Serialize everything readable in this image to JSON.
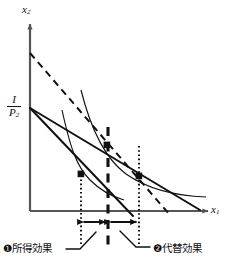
{
  "figure": {
    "type": "economics-indifference-curve-diagram",
    "title_visible": false,
    "axes": {
      "y_label": "x",
      "y_label_sub": "2",
      "x_label": "x",
      "x_label_sub": "1",
      "origin_px": [
        30,
        211
      ],
      "x_axis_end_px": [
        214,
        211
      ],
      "y_axis_end_px": [
        30,
        20
      ],
      "color": "#555555"
    },
    "y_intercept_label": {
      "numerator": "I",
      "bar": "",
      "denominator": "P",
      "denominator_sub": "2",
      "position_px": [
        8,
        97
      ]
    },
    "budget_lines": [
      {
        "name": "original-budget-line",
        "style": "solid",
        "from_px": [
          30,
          108
        ],
        "to_px": [
          200,
          210
        ],
        "color": "#111111",
        "width": 2.0
      },
      {
        "name": "new-budget-line",
        "style": "solid",
        "from_px": [
          30,
          108
        ],
        "to_px": [
          133,
          215
        ],
        "color": "#111111",
        "width": 2.0
      },
      {
        "name": "compensated-budget-line",
        "style": "dashed",
        "from_px": [
          30,
          53
        ],
        "to_px": [
          168,
          213
        ],
        "color": "#111111",
        "width": 2.0,
        "dash": "7,5"
      }
    ],
    "indifference_curves": [
      {
        "name": "lower-indifference-curve",
        "color": "#111111",
        "width": 1.1,
        "path": "M 62,110 C 72,150 78,168 92,182 C 102,192 112,197 124,200"
      },
      {
        "name": "upper-indifference-curve",
        "color": "#111111",
        "width": 1.1,
        "path": "M 81,90 C 92,128 104,158 126,175 C 148,191 178,196 206,197"
      }
    ],
    "vertical_lines": [
      {
        "name": "dotted-line-left",
        "x_px": 81,
        "from_y_px": 172,
        "to_y_px": 243,
        "style": "dotted",
        "color": "#111111",
        "width": 2.0
      },
      {
        "name": "dashed-line-middle",
        "x_px": 108,
        "from_y_px": 127,
        "to_y_px": 248,
        "style": "dashed",
        "color": "#111111",
        "width": 3.0
      },
      {
        "name": "dotted-line-right",
        "x_px": 139,
        "from_y_px": 147,
        "to_y_px": 243,
        "style": "dotted",
        "color": "#111111",
        "width": 2.0
      }
    ],
    "tangency_points": [
      {
        "name": "tangency-point-left",
        "x_px": 81,
        "y_px": 174
      },
      {
        "name": "tangency-point-middle",
        "x_px": 107,
        "y_px": 145
      },
      {
        "name": "tangency-point-right",
        "x_px": 139,
        "y_px": 176
      }
    ],
    "effect_arrows": [
      {
        "name": "income-effect-arrow",
        "from_x_px": 82,
        "to_x_px": 107,
        "y_px": 222,
        "double_headed": true
      },
      {
        "name": "substitution-effect-arrow",
        "from_x_px": 109,
        "to_x_px": 138,
        "y_px": 222,
        "double_headed": true
      }
    ],
    "annotations": [
      {
        "name": "income-effect-label",
        "marker": "❶",
        "text": "所得効果",
        "full": "❶所得効果",
        "position_px": [
          4,
          247
        ],
        "leader_from_px": [
          68,
          248
        ],
        "leader_to_px": [
          94,
          233
        ]
      },
      {
        "name": "substitution-effect-label",
        "marker": "❷",
        "text": "代替効果",
        "full": "❷代替効果",
        "position_px": [
          152,
          247
        ],
        "leader_from_px": [
          148,
          246
        ],
        "leader_to_px": [
          122,
          232
        ]
      }
    ]
  }
}
